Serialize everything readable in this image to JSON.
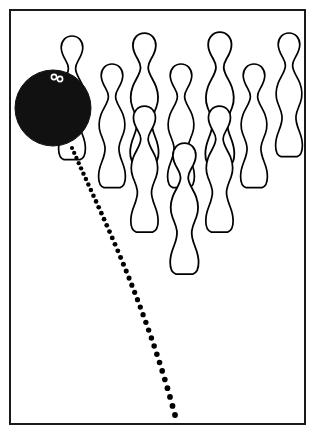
{
  "figure": {
    "title": "Bowling ball striking pin formation",
    "background_color": "#ffffff",
    "line_color": "#000000",
    "ball_color": "#111111",
    "frame": {
      "name": "figure-border",
      "x": 10,
      "y": 10,
      "width": 295,
      "height": 414,
      "stroke_width": 2
    }
  },
  "ball": {
    "label": "bowling-ball",
    "center_x": 53,
    "center_y": 108,
    "radius": 38,
    "fill": "#111111",
    "finger_holes": 2
  },
  "pins": [
    {
      "id": "pin-1",
      "label": "Pin behind ball",
      "x": 49,
      "y": 34,
      "scale": 1.0
    },
    {
      "id": "pin-2",
      "label": "Pin left mid",
      "x": 89,
      "y": 62,
      "scale": 1.0
    },
    {
      "id": "pin-3",
      "label": "Pin back left",
      "x": 120,
      "y": 31,
      "scale": 1.06
    },
    {
      "id": "pin-4",
      "label": "Pin mid left front",
      "x": 121,
      "y": 104,
      "scale": 1.02
    },
    {
      "id": "pin-5",
      "label": "Pin center mid",
      "x": 158,
      "y": 62,
      "scale": 1.0
    },
    {
      "id": "pin-6",
      "label": "Pin front center",
      "x": 160,
      "y": 141,
      "scale": 1.06
    },
    {
      "id": "pin-7",
      "label": "Pin back center",
      "x": 195,
      "y": 30,
      "scale": 1.08
    },
    {
      "id": "pin-8",
      "label": "Pin center front right",
      "x": 196,
      "y": 104,
      "scale": 1.02
    },
    {
      "id": "pin-9",
      "label": "Pin right mid",
      "x": 231,
      "y": 62,
      "scale": 1.0
    },
    {
      "id": "pin-10",
      "label": "Pin back right",
      "x": 266,
      "y": 31,
      "scale": 1.0
    }
  ],
  "trajectory": {
    "label": "ball-path-dotted-line",
    "style": "dotted",
    "dot_color": "#000000",
    "dot_count": 40,
    "start": {
      "x": 72,
      "y": 148
    },
    "end": {
      "x": 175,
      "y": 415
    },
    "control_1": {
      "x": 100,
      "y": 212
    },
    "control_2": {
      "x": 143,
      "y": 296
    },
    "dot_radius_start": 2.1,
    "dot_radius_end": 2.9
  }
}
